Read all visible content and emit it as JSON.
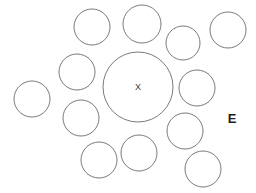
{
  "figure": {
    "width": 256,
    "height": 193,
    "background_color": "#ffffff",
    "stroke_color": "#6b6b6b",
    "label_color": "#1c1c1c"
  },
  "chart_data": {
    "type": "scatter",
    "title": "",
    "xlabel": "",
    "ylabel": "",
    "grid": false,
    "legend": "none",
    "xlim": [
      0,
      256
    ],
    "ylim": [
      0,
      193
    ],
    "series": [
      {
        "name": "center-circle",
        "points": [
          {
            "label": "X",
            "cx": 138,
            "cy": 87,
            "r": 35
          }
        ]
      },
      {
        "name": "surrounding-circles",
        "points": [
          {
            "label": "c1",
            "cx": 92,
            "cy": 27,
            "r": 18
          },
          {
            "label": "c2",
            "cx": 142,
            "cy": 24,
            "r": 19
          },
          {
            "label": "c3",
            "cx": 183,
            "cy": 43,
            "r": 17
          },
          {
            "label": "c4",
            "cx": 228,
            "cy": 30,
            "r": 18
          },
          {
            "label": "c5",
            "cx": 77,
            "cy": 72,
            "r": 18
          },
          {
            "label": "c6",
            "cx": 32,
            "cy": 99,
            "r": 18
          },
          {
            "label": "c7",
            "cx": 197,
            "cy": 88,
            "r": 18
          },
          {
            "label": "c8",
            "cx": 81,
            "cy": 118,
            "r": 18
          },
          {
            "label": "c9",
            "cx": 185,
            "cy": 131,
            "r": 18
          },
          {
            "label": "c10",
            "cx": 99,
            "cy": 160,
            "r": 18
          },
          {
            "label": "c11",
            "cx": 139,
            "cy": 153,
            "r": 18
          },
          {
            "label": "c12",
            "cx": 203,
            "cy": 169,
            "r": 18
          }
        ]
      }
    ]
  },
  "labels": {
    "center": {
      "text": "X",
      "x": 138,
      "y": 87
    },
    "right": {
      "text": "E",
      "x": 232,
      "y": 118
    }
  }
}
